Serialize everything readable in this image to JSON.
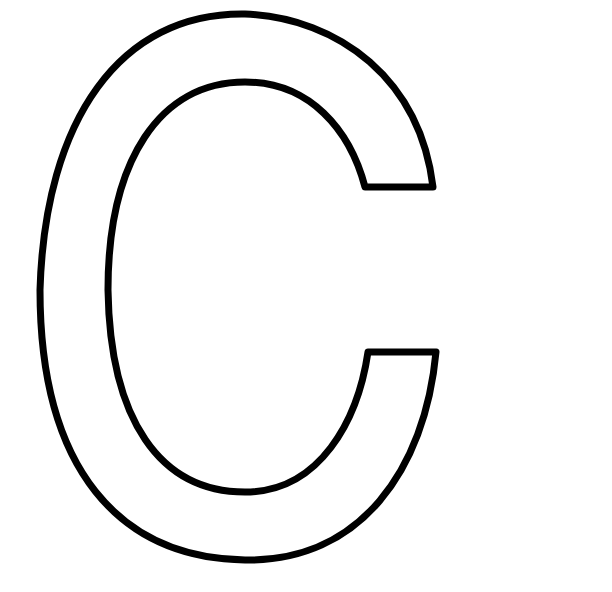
{
  "image": {
    "description": "Outlined capital letter C coloring page",
    "letter": "C",
    "stroke_color": "#000000",
    "fill_color": "#ffffff",
    "background": "#ffffff"
  }
}
